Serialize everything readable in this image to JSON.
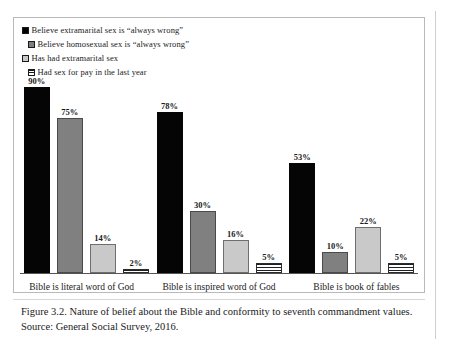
{
  "figure": {
    "caption": "Figure 3.2. Nature of belief about the Bible and conformity to seventh commandment values. Source: General Social Survey, 2016."
  },
  "chart_data": {
    "type": "bar",
    "title": "",
    "xlabel": "",
    "ylabel": "",
    "ylim": [
      0,
      100
    ],
    "grid": false,
    "legend_position": "top",
    "categories": [
      "Bible is literal word of God",
      "Bible is inspired word of God",
      "Bible is book of fables"
    ],
    "series": [
      {
        "name": "Believe  extramarital sex is “always wrong”",
        "marker": "solid-black-square",
        "color": "#050505",
        "values": [
          90,
          78,
          53
        ],
        "labels": [
          "90%",
          "78%",
          "53%"
        ]
      },
      {
        "name": "Believe  homosexual sex is “always wrong”",
        "marker": "gray-square",
        "color": "#808080",
        "values": [
          75,
          30,
          10
        ],
        "labels": [
          "75%",
          "30%",
          "10%"
        ]
      },
      {
        "name": "Has had extramarital sex",
        "marker": "light-gray-square",
        "color": "#c9c9c9",
        "values": [
          14,
          16,
          22
        ],
        "labels": [
          "14%",
          "16%",
          "22%"
        ]
      },
      {
        "name": "Had sex for pay in the last year",
        "marker": "horizontal-striped-square",
        "color": "#ffffff",
        "values": [
          2,
          5,
          5
        ],
        "labels": [
          "2%",
          "5%",
          "5%"
        ]
      }
    ]
  }
}
